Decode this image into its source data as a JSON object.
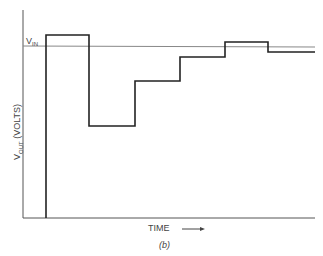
{
  "figure": {
    "caption": "(b)",
    "vin_label": "V",
    "vin_sub": "IN",
    "y_label_main": "V",
    "y_label_sub": "OUT",
    "y_label_rest": " (VOLTS)",
    "x_label": "TIME",
    "x_arrow": "→"
  },
  "waveform": {
    "description": "Step response of V_OUT oscillating around V_IN over time",
    "levels_px": [
      {
        "x_start": 46,
        "x_end": 89,
        "y": 35
      },
      {
        "x_start": 89,
        "x_end": 135,
        "y": 126
      },
      {
        "x_start": 135,
        "x_end": 180,
        "y": 81
      },
      {
        "x_start": 180,
        "x_end": 225,
        "y": 57
      },
      {
        "x_start": 225,
        "x_end": 268,
        "y": 42
      },
      {
        "x_start": 268,
        "x_end": 315,
        "y": 52
      }
    ],
    "vin_y": 46
  }
}
